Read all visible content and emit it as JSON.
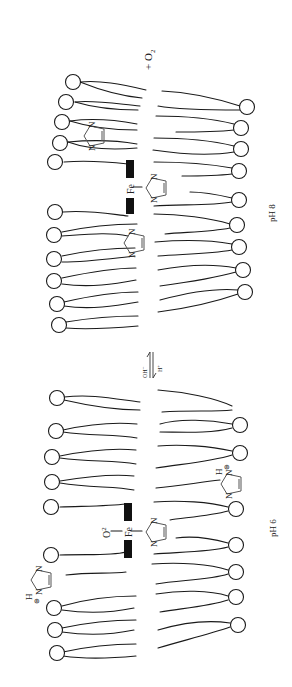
{
  "figure": {
    "orientation": "rotated-90-ccw",
    "top_panel": {
      "condition_label": "pH 8",
      "released_species": "+ O",
      "released_species_subscript": "2",
      "metal_label": "Fe",
      "imidazole_atom_label": "N"
    },
    "bottom_panel": {
      "condition_label": "pH 6",
      "bound_ligand": "O",
      "bound_ligand_subscript": "2",
      "metal_label": "Fe",
      "imidazole_atom_label": "N",
      "protonated_atom_label": "H",
      "charge_symbol": "⊕"
    },
    "equilibrium": {
      "upper_reagent": "OH",
      "upper_reagent_charge": "−",
      "lower_reagent": "H",
      "lower_reagent_charge": "+"
    }
  }
}
